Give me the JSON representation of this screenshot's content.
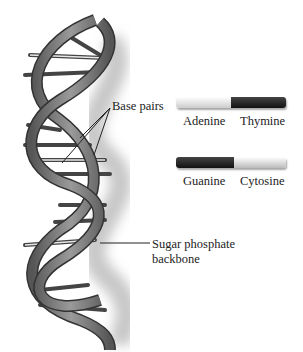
{
  "diagram": {
    "labels": {
      "base_pairs": "Base pairs",
      "sugar_phosphate": "Sugar phosphate",
      "backbone": "backbone"
    },
    "pairs": [
      {
        "left": "Adenine",
        "right": "Thymine",
        "left_color": "#eeeeee",
        "right_color": "#222222"
      },
      {
        "left": "Guanine",
        "right": "Cytosine",
        "left_color": "#2a2a2a",
        "right_color": "#dddddd"
      }
    ]
  }
}
